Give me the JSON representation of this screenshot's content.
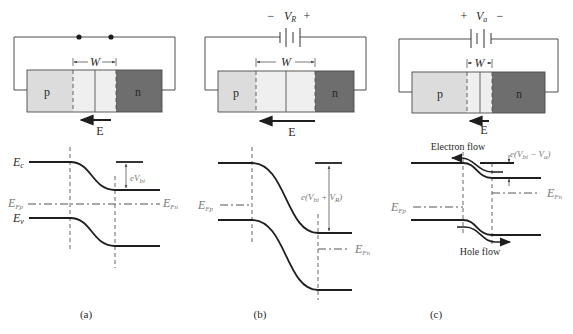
{
  "colors": {
    "p_region": "#dcdcdc",
    "depletion": "#efefef",
    "n_region": "#6e6e6e",
    "lines": "#1e1e1e"
  },
  "panels": [
    {
      "id": "a",
      "caption": "(a)",
      "bias": "zero bias",
      "source": {
        "type": "short (two contact dots)",
        "left_sign": "",
        "right_sign": "",
        "label": ""
      },
      "block": {
        "p_label": "p",
        "n_label": "n",
        "width_label": "W",
        "field_label": "E"
      },
      "bands": {
        "ec_label": "E",
        "ec_sub": "c",
        "ev_label": "E",
        "ev_sub": "v",
        "efp_label": "E",
        "efp_sub": "Fp",
        "efn_label": "E",
        "efn_sub": "Fn",
        "barrier_prefix": "eV",
        "barrier_sub": "bi"
      }
    },
    {
      "id": "b",
      "caption": "(b)",
      "bias": "reverse bias",
      "source": {
        "type": "battery",
        "left_sign": "−",
        "right_sign": "+",
        "label": "V",
        "label_sub": "R"
      },
      "block": {
        "p_label": "p",
        "n_label": "n",
        "width_label": "W",
        "field_label": "E"
      },
      "bands": {
        "efp_label": "E",
        "efp_sub": "Fp",
        "efn_label": "E",
        "efn_sub": "Fn",
        "barrier_text_1": "e(V",
        "barrier_sub_1": "bi",
        "barrier_text_2": " + V",
        "barrier_sub_2": "R",
        "barrier_text_3": ")"
      }
    },
    {
      "id": "c",
      "caption": "(c)",
      "bias": "forward bias",
      "source": {
        "type": "battery",
        "left_sign": "+",
        "right_sign": "−",
        "label": "V",
        "label_sub": "a"
      },
      "block": {
        "p_label": "p",
        "n_label": "n",
        "width_label": "W",
        "field_label": "E"
      },
      "bands": {
        "efp_label": "E",
        "efp_sub": "Fp",
        "efn_label": "E",
        "efn_sub": "Fn",
        "barrier_text_1": "e(V",
        "barrier_sub_1": "bi",
        "barrier_text_2": " − V",
        "barrier_sub_2": "a",
        "barrier_text_3": ")",
        "electron_flow_label": "Electron flow",
        "hole_flow_label": "Hole flow"
      }
    }
  ]
}
